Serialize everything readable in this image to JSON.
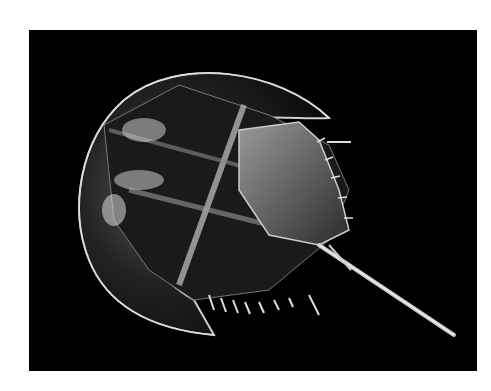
{
  "image": {
    "subject": "horseshoe crab",
    "background_color": "#000000",
    "frame_color": "#ffffff"
  }
}
